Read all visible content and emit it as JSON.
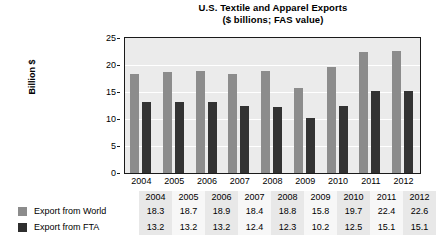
{
  "chart_data": {
    "type": "bar",
    "title": "U.S. Textile and Apparel Exports",
    "subtitle": "($ billions; FAS value)",
    "xlabel": "",
    "ylabel": "Billion $",
    "ylim": [
      0,
      25
    ],
    "ytick_step": 5,
    "yticks": [
      "0",
      "5",
      "10",
      "15",
      "20",
      "25"
    ],
    "grid": true,
    "gridline_values": [
      5,
      10,
      15,
      20
    ],
    "legend_position": "table-below",
    "categories": [
      "2004",
      "2005",
      "2006",
      "2007",
      "2008",
      "2009",
      "2010",
      "2011",
      "2012"
    ],
    "series": [
      {
        "name": "Export from World",
        "color": "#8c8c8c",
        "values": [
          18.3,
          18.7,
          18.9,
          18.4,
          18.8,
          15.8,
          19.7,
          22.4,
          22.6
        ]
      },
      {
        "name": "Export from FTA",
        "color": "#333333",
        "values": [
          13.2,
          13.2,
          13.2,
          12.4,
          12.3,
          10.2,
          12.5,
          15.1,
          15.1
        ]
      }
    ]
  },
  "table": {
    "header": [
      "2004",
      "2005",
      "2006",
      "2007",
      "2008",
      "2009",
      "2010",
      "2011",
      "2012"
    ],
    "rows": [
      {
        "label": "Export from World",
        "swatch_color": "#8c8c8c",
        "values": [
          "18.3",
          "18.7",
          "18.9",
          "18.4",
          "18.8",
          "15.8",
          "19.7",
          "22.4",
          "22.6"
        ]
      },
      {
        "label": "Export from FTA",
        "swatch_color": "#2e2e2e",
        "values": [
          "13.2",
          "13.2",
          "13.2",
          "12.4",
          "12.3",
          "10.2",
          "12.5",
          "15.1",
          "15.1"
        ]
      }
    ]
  },
  "colors": {
    "plot_background": "#ebebeb",
    "gridline": "#ffffff",
    "axis": "#1a1a1a",
    "series_world": "#8c8c8c",
    "series_fta": "#333333"
  }
}
